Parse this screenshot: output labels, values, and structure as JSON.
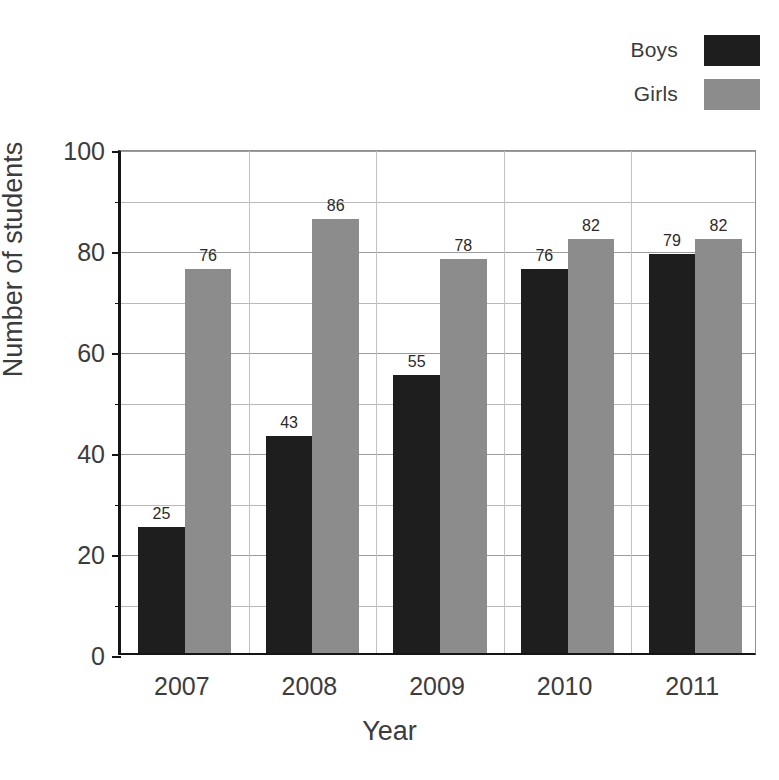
{
  "chart_data": {
    "type": "bar",
    "title": "",
    "xlabel": "Year",
    "ylabel": "Number of students",
    "categories": [
      "2007",
      "2008",
      "2009",
      "2010",
      "2011"
    ],
    "series": [
      {
        "name": "Boys",
        "color": "#1e1e1e",
        "values": [
          25,
          43,
          55,
          76,
          79
        ]
      },
      {
        "name": "Girls",
        "color": "#8c8c8c",
        "values": [
          76,
          86,
          78,
          82,
          82
        ]
      }
    ],
    "ylim": [
      0,
      100
    ],
    "ytick_labels": [
      "0",
      "20",
      "40",
      "60",
      "80",
      "100"
    ],
    "ytick_values": [
      0,
      20,
      40,
      60,
      80,
      100
    ],
    "yminor_values": [
      10,
      30,
      50,
      70,
      90
    ],
    "grid": true,
    "grid_axis": "both",
    "legend_position": "top-right",
    "data_labels": true
  },
  "legend": {
    "entries": [
      {
        "label": "Boys",
        "color": "#1e1e1e"
      },
      {
        "label": "Girls",
        "color": "#8c8c8c"
      }
    ]
  },
  "axes": {
    "x_title": "Year",
    "y_title": "Number of students"
  }
}
